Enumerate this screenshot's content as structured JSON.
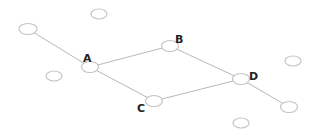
{
  "diagram": {
    "type": "graph",
    "nodes": [
      {
        "id": "n1",
        "label": "",
        "x": 28,
        "y": 29
      },
      {
        "id": "n2",
        "label": "",
        "x": 99,
        "y": 14
      },
      {
        "id": "A",
        "label": "A",
        "x": 90,
        "y": 67
      },
      {
        "id": "n3",
        "label": "",
        "x": 54,
        "y": 76
      },
      {
        "id": "B",
        "label": "B",
        "x": 170,
        "y": 46
      },
      {
        "id": "C",
        "label": "C",
        "x": 154,
        "y": 101
      },
      {
        "id": "D",
        "label": "D",
        "x": 241,
        "y": 79
      },
      {
        "id": "n4",
        "label": "",
        "x": 293,
        "y": 61
      },
      {
        "id": "n5",
        "label": "",
        "x": 289,
        "y": 107
      },
      {
        "id": "n6",
        "label": "",
        "x": 241,
        "y": 123
      }
    ],
    "edges": [
      {
        "from": "n1",
        "to": "A"
      },
      {
        "from": "A",
        "to": "B"
      },
      {
        "from": "A",
        "to": "C"
      },
      {
        "from": "B",
        "to": "D"
      },
      {
        "from": "C",
        "to": "D"
      },
      {
        "from": "D",
        "to": "n5"
      }
    ],
    "labels": {
      "A": "A",
      "B": "B",
      "C": "C",
      "D": "D"
    }
  }
}
